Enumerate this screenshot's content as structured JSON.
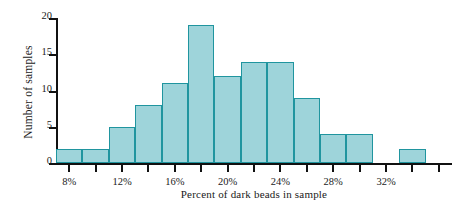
{
  "chart_data": {
    "type": "bar",
    "title": "",
    "xlabel": "Percent of dark beads in sample",
    "ylabel": "Number of samples",
    "categories": [
      "6%",
      "8%",
      "10%",
      "12%",
      "14%",
      "16%",
      "18%",
      "20%",
      "22%",
      "24%",
      "26%",
      "28%",
      "30%",
      "32%",
      "34%"
    ],
    "bin_starts": [
      6,
      8,
      10,
      12,
      14,
      16,
      18,
      20,
      22,
      24,
      26,
      28,
      30,
      32,
      34
    ],
    "bin_width": 2,
    "values": [
      2,
      2,
      5,
      8,
      11,
      19,
      12,
      14,
      14,
      9,
      4,
      4,
      0,
      2,
      0
    ],
    "xlim": [
      6,
      36
    ],
    "ylim": [
      0,
      20
    ],
    "ytick_values": [
      0,
      5,
      10,
      15,
      20
    ],
    "ytick_labels": [
      "0",
      "5",
      "10",
      "15",
      "20"
    ],
    "xtick_values": [
      7,
      9,
      11,
      13,
      15,
      17,
      19,
      21,
      23,
      25,
      27,
      29,
      31,
      33,
      35
    ],
    "xtick_labeled": [
      {
        "value": 7,
        "label": "8%"
      },
      {
        "value": 11,
        "label": "12%"
      },
      {
        "value": 15,
        "label": "16%"
      },
      {
        "value": 19,
        "label": "20%"
      },
      {
        "value": 23,
        "label": "24%"
      },
      {
        "value": 27,
        "label": "28%"
      },
      {
        "value": 31,
        "label": "32%"
      }
    ],
    "grid": false,
    "legend": null,
    "bar_fill_color": "#9ed4da",
    "bar_edge_color": "#20959f",
    "axis_color": "#111111"
  }
}
